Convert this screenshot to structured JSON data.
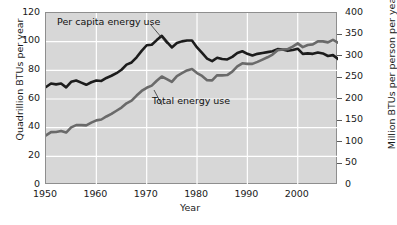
{
  "chart_data": {
    "type": "line",
    "title": "",
    "xlabel": "Year",
    "ylabel": "Quadrillion BTUs per year",
    "ylabel_right": "Million BTUs per person per year",
    "xlim": [
      1950,
      2008
    ],
    "ylim": [
      0,
      120
    ],
    "ylim_right": [
      0,
      400
    ],
    "xticks": [
      1950,
      1960,
      1970,
      1980,
      1990,
      2000
    ],
    "xtick_labels": [
      "1950",
      "1960",
      "1970",
      "1980",
      "1990",
      "2000"
    ],
    "yticks": [
      0,
      20,
      40,
      60,
      80,
      100,
      120
    ],
    "ytick_labels": [
      "0",
      "20",
      "40",
      "60",
      "80",
      "100",
      "120"
    ],
    "yticks_right": [
      0,
      50,
      100,
      150,
      200,
      250,
      300,
      350,
      400
    ],
    "ytick_labels_right": [
      "0",
      "50",
      "100",
      "150",
      "200",
      "250",
      "300",
      "350",
      "400"
    ],
    "grid": true,
    "grid_color": "#ffffff",
    "plot_background": "#d7d7d7",
    "legend": "annotations",
    "annotations": [
      {
        "text": "Per capita energy use",
        "series": "per_capita_energy_use"
      },
      {
        "text": "Total energy use",
        "series": "total_energy_use"
      }
    ],
    "series": [
      {
        "name": "Per capita energy use",
        "axis": "right",
        "units": "Million BTUs per person per year",
        "color": "#1c1c1c",
        "x": [
          1950,
          1951,
          1952,
          1953,
          1954,
          1955,
          1956,
          1957,
          1958,
          1959,
          1960,
          1961,
          1962,
          1963,
          1964,
          1965,
          1966,
          1967,
          1968,
          1969,
          1970,
          1971,
          1972,
          1973,
          1974,
          1975,
          1976,
          1977,
          1978,
          1979,
          1980,
          1981,
          1982,
          1983,
          1984,
          1985,
          1986,
          1987,
          1988,
          1989,
          1990,
          1991,
          1992,
          1993,
          1994,
          1995,
          1996,
          1997,
          1998,
          1999,
          2000,
          2001,
          2002,
          2003,
          2004,
          2005,
          2006,
          2007,
          2008
        ],
        "values": [
          228,
          236,
          234,
          236,
          227,
          240,
          243,
          238,
          233,
          239,
          243,
          242,
          249,
          254,
          260,
          268,
          280,
          285,
          297,
          312,
          325,
          326,
          337,
          347,
          333,
          320,
          330,
          334,
          336,
          336,
          320,
          307,
          294,
          288,
          296,
          293,
          292,
          298,
          307,
          311,
          305,
          301,
          305,
          307,
          309,
          311,
          316,
          315,
          312,
          314,
          317,
          305,
          306,
          305,
          308,
          306,
          300,
          302,
          293
        ]
      },
      {
        "name": "Total energy use",
        "axis": "left",
        "units": "Quadrillion BTUs per year",
        "color": "#6a6a6a",
        "x": [
          1950,
          1951,
          1952,
          1953,
          1954,
          1955,
          1956,
          1957,
          1958,
          1959,
          1960,
          1961,
          1962,
          1963,
          1964,
          1965,
          1966,
          1967,
          1968,
          1969,
          1970,
          1971,
          1972,
          1973,
          1974,
          1975,
          1976,
          1977,
          1978,
          1979,
          1980,
          1981,
          1982,
          1983,
          1984,
          1985,
          1986,
          1987,
          1988,
          1989,
          1990,
          1991,
          1992,
          1993,
          1994,
          1995,
          1996,
          1997,
          1998,
          1999,
          2000,
          2001,
          2002,
          2003,
          2004,
          2005,
          2006,
          2007,
          2008
        ],
        "values": [
          34.6,
          36.9,
          37.0,
          37.7,
          36.6,
          40.2,
          41.8,
          41.8,
          41.6,
          43.5,
          45.1,
          45.7,
          47.8,
          49.6,
          51.8,
          54.0,
          57.0,
          58.9,
          62.4,
          65.6,
          67.8,
          69.3,
          72.7,
          75.7,
          73.9,
          71.9,
          76.0,
          78.0,
          79.9,
          80.9,
          78.1,
          76.1,
          73.1,
          73.0,
          76.6,
          76.5,
          76.7,
          79.1,
          82.7,
          84.9,
          84.5,
          84.5,
          85.9,
          87.5,
          89.1,
          91.0,
          94.0,
          94.6,
          94.7,
          96.6,
          98.8,
          96.2,
          97.7,
          98.1,
          100.2,
          100.2,
          99.5,
          101.3,
          99.3
        ]
      }
    ]
  },
  "axes": {
    "x_title": "Year",
    "y_left_title": "Quadrillion BTUs per year",
    "y_right_title": "Million BTUs per person per year"
  },
  "labels": {
    "per_capita": "Per capita energy use",
    "total": "Total energy use"
  }
}
